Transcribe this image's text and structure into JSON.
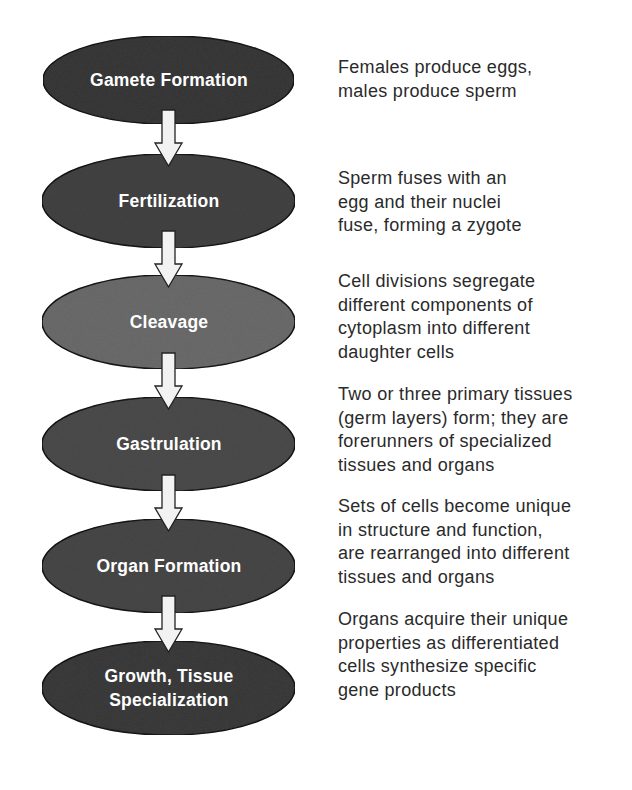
{
  "colors": {
    "background": "#ffffff",
    "ellipse_stroke": "#1a1a1a",
    "arrow_fill": "#f2f2f2",
    "arrow_stroke": "#222222",
    "label_text": "#ffffff",
    "description_text": "#2a2a2a"
  },
  "stages": [
    {
      "label_lines": [
        "Gamete Formation"
      ],
      "fill": "#3b3b3b",
      "description_lines": [
        "Females produce eggs,",
        "males produce sperm"
      ]
    },
    {
      "label_lines": [
        "Fertilization"
      ],
      "fill": "#444444",
      "description_lines": [
        "Sperm fuses with an",
        "egg and their nuclei",
        "fuse, forming a zygote"
      ]
    },
    {
      "label_lines": [
        "Cleavage"
      ],
      "fill": "#6d6d6d",
      "description_lines": [
        "Cell divisions segregate",
        "different components of",
        "cytoplasm into different",
        "daughter cells"
      ]
    },
    {
      "label_lines": [
        "Gastrulation"
      ],
      "fill": "#4d4d4d",
      "description_lines": [
        "Two or three primary tissues",
        "(germ layers) form; they are",
        "forerunners of specialized",
        "tissues and organs"
      ]
    },
    {
      "label_lines": [
        "Organ Formation"
      ],
      "fill": "#4a4a4a",
      "description_lines": [
        "Sets of cells become unique",
        "in structure and function,",
        "are rearranged into different",
        "tissues and organs"
      ]
    },
    {
      "label_lines": [
        "Growth, Tissue",
        "Specialization"
      ],
      "fill": "#3d3d3d",
      "description_lines": [
        "Organs acquire their unique",
        "properties as differentiated",
        "cells synthesize specific",
        "gene products"
      ]
    }
  ],
  "arrows": [
    {
      "from": "Gamete Formation",
      "to": "Fertilization"
    },
    {
      "from": "Fertilization",
      "to": "Cleavage"
    },
    {
      "from": "Cleavage",
      "to": "Gastrulation"
    },
    {
      "from": "Gastrulation",
      "to": "Organ Formation"
    },
    {
      "from": "Organ Formation",
      "to": "Growth, Tissue Specialization"
    }
  ]
}
